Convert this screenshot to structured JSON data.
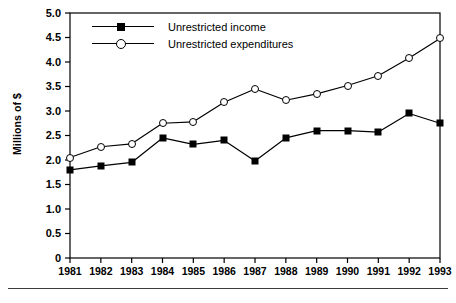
{
  "chart_data": {
    "type": "line",
    "title": "",
    "xlabel": "",
    "ylabel": "Millions of $",
    "categories": [
      "1981",
      "1982",
      "1983",
      "1984",
      "1985",
      "1986",
      "1987",
      "1988",
      "1989",
      "1990",
      "1991",
      "1992",
      "1993"
    ],
    "x": [
      1981,
      1982,
      1983,
      1984,
      1985,
      1986,
      1987,
      1988,
      1989,
      1990,
      1991,
      1992,
      1993
    ],
    "xlim": [
      1981,
      1993
    ],
    "ylim": [
      0,
      5.0
    ],
    "yticks": [
      "0",
      "0.5",
      "1.0",
      "1.5",
      "2.0",
      "2.5",
      "3.0",
      "3.5",
      "4.0",
      "4.5",
      "5.0"
    ],
    "ytick_values": [
      0,
      0.5,
      1.0,
      1.5,
      2.0,
      2.5,
      3.0,
      3.5,
      4.0,
      4.5,
      5.0
    ],
    "grid": false,
    "legend_position": "top-left",
    "series": [
      {
        "name": "Unrestricted income",
        "marker": "filled-square",
        "color": "#000000",
        "values": [
          1.8,
          1.88,
          1.95,
          2.45,
          2.32,
          2.4,
          1.98,
          2.45,
          2.6,
          2.6,
          2.57,
          2.95,
          2.75
        ]
      },
      {
        "name": "Unrestricted expenditures",
        "marker": "open-circle",
        "color": "#000000",
        "values": [
          2.05,
          2.27,
          2.33,
          2.75,
          2.78,
          3.18,
          3.45,
          3.22,
          3.35,
          3.52,
          3.72,
          4.08,
          4.48
        ]
      }
    ]
  },
  "axis": {
    "ylabel": "Millions of $"
  },
  "legend": {
    "items": [
      {
        "label": "Unrestricted income"
      },
      {
        "label": "Unrestricted expenditures"
      }
    ]
  }
}
